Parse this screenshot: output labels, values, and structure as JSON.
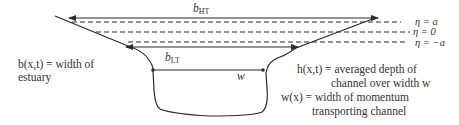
{
  "diagram": {
    "labels": {
      "b_ht": {
        "symbol": "b",
        "subscript": "HT"
      },
      "b_lt": {
        "symbol": "b",
        "subscript": "LT"
      },
      "w": "w",
      "eta_a": "η = a",
      "eta_0": "η = 0",
      "eta_neg_a": "η = −a",
      "b_def_line1": "b(x,t) = width of",
      "b_def_line2": "estuary",
      "h_def_line1": "h(x,t) = averaged depth of",
      "h_def_line2": "channel over width w",
      "w_def_line1": "w(x) = width of momentum",
      "w_def_line2": "transporting channel"
    },
    "colors": {
      "line": "#2a2a2a",
      "text": "#333333",
      "background": "#ffffff"
    }
  }
}
